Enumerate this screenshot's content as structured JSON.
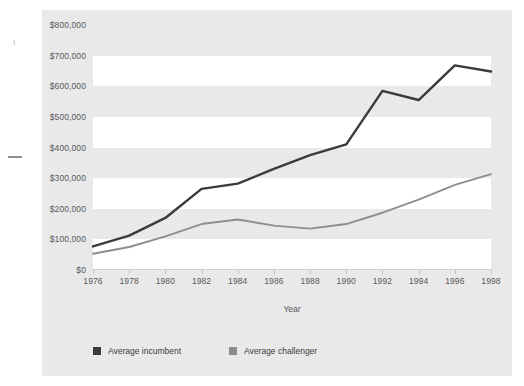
{
  "page": {
    "margin_artifact_text": "t",
    "background_color": "#ffffff"
  },
  "figure": {
    "panel_color": "#e9e9e9",
    "band_color": "#ffffff"
  },
  "legend": {
    "position": "bottom-left",
    "items": [
      {
        "label": "Average incumbent",
        "color": "#3a3a3a"
      },
      {
        "label": "Average challenger",
        "color": "#8e8e8e"
      }
    ]
  },
  "chart_data": {
    "type": "line",
    "title": "",
    "subtitle": "",
    "xlabel": "Year",
    "ylabel": "",
    "x": [
      1976,
      1978,
      1980,
      1982,
      1984,
      1986,
      1988,
      1990,
      1992,
      1994,
      1996,
      1998
    ],
    "categories": [
      "1976",
      "1978",
      "1980",
      "1982",
      "1984",
      "1986",
      "1988",
      "1990",
      "1992",
      "1994",
      "1996",
      "1998"
    ],
    "xtick_labels": [
      "1976",
      "1978",
      "1980",
      "1982",
      "1984",
      "1986",
      "1988",
      "1990",
      "1992",
      "1994",
      "1996",
      "1998"
    ],
    "ytick_labels": [
      "$0",
      "$100,000",
      "$200,000",
      "$300,000",
      "$400,000",
      "$500,000",
      "$600,000",
      "$700,000",
      "$800,000"
    ],
    "ytick_values": [
      0,
      100000,
      200000,
      300000,
      400000,
      500000,
      600000,
      700000,
      800000
    ],
    "ylim": [
      0,
      800000
    ],
    "xlim": [
      1976,
      1998
    ],
    "grid": "horizontal-bands",
    "legend_position": "bottom-left",
    "series": [
      {
        "name": "Average incumbent",
        "color": "#3a3a3a",
        "values": [
          77000,
          112000,
          170000,
          265000,
          282000,
          330000,
          375000,
          410000,
          585000,
          555000,
          668000,
          648000
        ]
      },
      {
        "name": "Average challenger",
        "color": "#8e8e8e",
        "values": [
          53000,
          75000,
          110000,
          150000,
          165000,
          145000,
          135000,
          150000,
          187000,
          230000,
          278000,
          313000
        ]
      }
    ]
  }
}
